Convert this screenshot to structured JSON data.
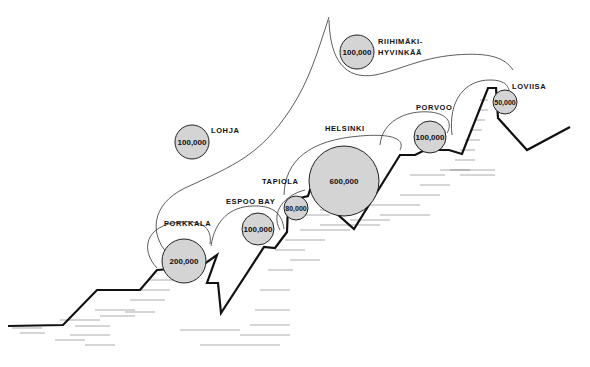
{
  "diagram": {
    "type": "regional development diagram (Helsinki region, Gulf of Finland coast)",
    "colors": {
      "circle_fill": "#d4d4d4",
      "line": "#111111",
      "background": "#ffffff"
    },
    "cities": [
      {
        "id": "riihimaki",
        "name_line1": "RIIHIMÄKI-",
        "name_line2": "HYVINKÄÄ",
        "population": "100,000",
        "cx": 357,
        "cy": 52,
        "r": 17
      },
      {
        "id": "lohja",
        "name": "LOHJA",
        "population": "100,000",
        "cx": 192,
        "cy": 142,
        "r": 17
      },
      {
        "id": "porkkala",
        "name": "PORKKALA",
        "population": "200,000",
        "cx": 184,
        "cy": 261,
        "r": 22
      },
      {
        "id": "espoo-bay",
        "name": "ESPOO BAY",
        "population": "100,000",
        "cx": 258,
        "cy": 229,
        "r": 16
      },
      {
        "id": "tapiola",
        "name": "TAPIOLA",
        "population": "80,000",
        "cx": 296,
        "cy": 208,
        "r": 12
      },
      {
        "id": "helsinki",
        "name": "HELSINKI",
        "population": "600,000",
        "cx": 344,
        "cy": 181,
        "r": 35
      },
      {
        "id": "porvoo",
        "name": "PORVOO",
        "population": "100,000",
        "cx": 430,
        "cy": 137,
        "r": 16
      },
      {
        "id": "loviisa",
        "name": "LOVIISA",
        "population": "50,000",
        "cx": 505,
        "cy": 102,
        "r": 12
      }
    ]
  }
}
